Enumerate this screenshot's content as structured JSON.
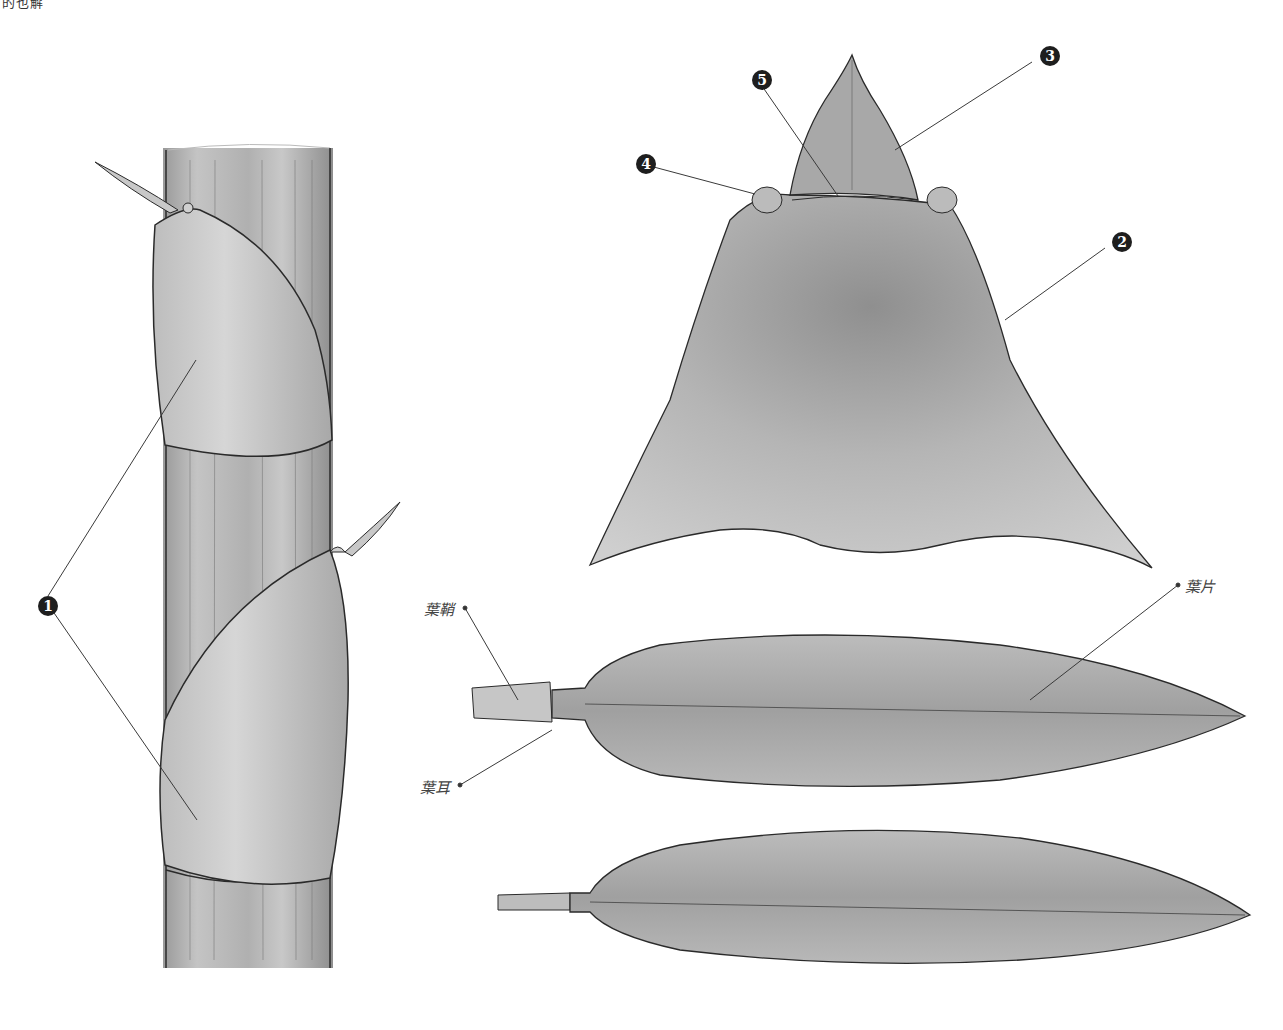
{
  "diagram": {
    "header_fragment": "的也解",
    "markers": [
      {
        "id": "1",
        "x": 38,
        "y": 596
      },
      {
        "id": "2",
        "x": 1112,
        "y": 232
      },
      {
        "id": "3",
        "x": 1040,
        "y": 48
      },
      {
        "id": "4",
        "x": 636,
        "y": 154
      },
      {
        "id": "5",
        "x": 752,
        "y": 70
      }
    ],
    "labels": {
      "sheath": "葉鞘",
      "auricle": "葉耳",
      "blade": "葉片"
    },
    "colors": {
      "ink": "#2a2a2a",
      "fill_light": "#c9c9c9",
      "fill_mid": "#a9a9a9",
      "fill_dark": "#8a8a8a",
      "marker": "#1e1e1e",
      "label_text": "#444444"
    }
  }
}
